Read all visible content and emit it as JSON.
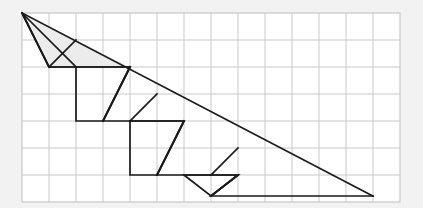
{
  "figure": {
    "kind": "geometry-diagram",
    "caption": "",
    "background_color": "#f2f2f2",
    "paper_color": "#ffffff",
    "grid_color": "#c9c9ce",
    "grid_border_color": "#bdbdc4",
    "stroke_color": "#1a1a1a",
    "shade_color": "#ececed",
    "stroke_width": 1.7,
    "grid": {
      "origin_x": 22,
      "origin_y": 13,
      "cell_size": 27,
      "columns": 14,
      "rows": 7,
      "right_x": 400,
      "bottom_y": 202
    },
    "triangle": {
      "label": "outer-triangle",
      "apex": [
        22,
        13
      ],
      "bottom_right": [
        373,
        196
      ],
      "bottom_left": [
        22,
        196
      ],
      "points": "22,13 373,196 22,196"
    },
    "hypotenuse": {
      "label": "hypotenuse",
      "from": [
        22,
        13
      ],
      "to": [
        373,
        196
      ]
    },
    "staircase": {
      "label": "staircase-polyline",
      "step_count": 7,
      "points": "22,13 49,67 130,67 103,121 184,121 157,175 238,175 211,196 373,196"
    },
    "steps": [
      {
        "name": "step-1",
        "tread": [
          [
            49,
            67
          ],
          [
            130,
            67
          ]
        ],
        "riser_from": [
          22,
          13
        ],
        "riser_to": [
          49,
          67
        ]
      },
      {
        "name": "step-2",
        "tread": [
          [
            103,
            121
          ],
          [
            184,
            121
          ]
        ],
        "riser_from": [
          130,
          67
        ],
        "riser_to": [
          103,
          121
        ]
      },
      {
        "name": "step-3",
        "tread": [
          [
            157,
            175
          ],
          [
            238,
            175
          ]
        ],
        "riser_from": [
          184,
          121
        ],
        "riser_to": [
          157,
          175
        ]
      },
      {
        "name": "step-4",
        "tread": [
          [
            211,
            196
          ],
          [
            373,
            196
          ]
        ],
        "riser_from": [
          238,
          175
        ],
        "riser_to": [
          211,
          196
        ]
      }
    ],
    "cells": [
      {
        "name": "cell-1",
        "points": "22,13 76,67 49,67"
      },
      {
        "name": "cell-2",
        "points": "76,67 130,67 103,121 76,121"
      },
      {
        "name": "cell-3",
        "points": "130,121 184,121 157,175 130,175"
      },
      {
        "name": "cell-4",
        "points": "184,175 238,175 211,196"
      }
    ],
    "shaded_regions": [
      {
        "name": "shade-upper-left",
        "points": "22,13 130,67 49,67"
      }
    ],
    "risers": [
      {
        "name": "riser-a",
        "from": [
          22,
          13
        ],
        "to": [
          49,
          67
        ]
      },
      {
        "name": "riser-b",
        "from": [
          76,
          40
        ],
        "to": [
          49,
          67
        ]
      },
      {
        "name": "riser-c",
        "from": [
          130,
          67
        ],
        "to": [
          103,
          121
        ]
      },
      {
        "name": "riser-d",
        "from": [
          157,
          94
        ],
        "to": [
          130,
          121
        ]
      },
      {
        "name": "riser-e",
        "from": [
          184,
          121
        ],
        "to": [
          157,
          175
        ]
      },
      {
        "name": "riser-f",
        "from": [
          238,
          148
        ],
        "to": [
          211,
          175
        ]
      },
      {
        "name": "riser-g",
        "from": [
          238,
          175
        ],
        "to": [
          211,
          196
        ]
      }
    ]
  }
}
